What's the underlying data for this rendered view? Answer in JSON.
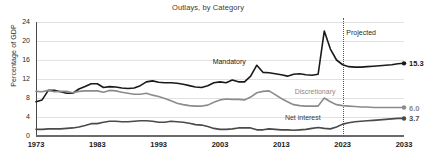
{
  "chart_data": {
    "type": "line",
    "title": "Outlays, by Category",
    "xlabel": "",
    "ylabel": "Percentage of GDP",
    "xlim": [
      1973,
      2033
    ],
    "ylim": [
      0,
      24
    ],
    "yticks": [
      0,
      4,
      8,
      12,
      16,
      20,
      24
    ],
    "xticks": [
      1973,
      1983,
      1993,
      2003,
      2013,
      2023,
      2033
    ],
    "grid": true,
    "legend": "inline-annotations",
    "annotations": [
      {
        "text": "Projected",
        "x": 2023.6,
        "y": 22.6
      },
      {
        "text": "Mandatory",
        "x": 2004.5,
        "y": 16.4
      },
      {
        "text": "Discretionary",
        "x": 2018.5,
        "y": 10.2
      },
      {
        "text": "Net interest",
        "x": 2016.5,
        "y": 4.6
      }
    ],
    "projection_start": 2023,
    "x": [
      1973,
      1974,
      1975,
      1976,
      1977,
      1978,
      1979,
      1980,
      1981,
      1982,
      1983,
      1984,
      1985,
      1986,
      1987,
      1988,
      1989,
      1990,
      1991,
      1992,
      1993,
      1994,
      1995,
      1996,
      1997,
      1998,
      1999,
      2000,
      2001,
      2002,
      2003,
      2004,
      2005,
      2006,
      2007,
      2008,
      2009,
      2010,
      2011,
      2012,
      2013,
      2014,
      2015,
      2016,
      2017,
      2018,
      2019,
      2020,
      2021,
      2022,
      2023,
      2024,
      2025,
      2026,
      2027,
      2028,
      2029,
      2030,
      2031,
      2032,
      2033
    ],
    "series": [
      {
        "name": "Mandatory",
        "color": "#1a1a1a",
        "end_label": "15.3",
        "end_value": 15.3,
        "values": [
          7.2,
          7.6,
          9.6,
          9.6,
          9.3,
          9.0,
          9.0,
          9.9,
          10.4,
          11.0,
          11.0,
          10.2,
          10.4,
          10.3,
          10.1,
          10.0,
          10.1,
          10.6,
          11.4,
          11.6,
          11.3,
          11.2,
          11.2,
          11.1,
          10.9,
          10.6,
          10.3,
          10.2,
          10.6,
          11.2,
          11.4,
          11.2,
          11.8,
          11.4,
          11.4,
          12.6,
          14.9,
          13.4,
          13.3,
          13.1,
          12.9,
          12.6,
          13.0,
          13.1,
          12.9,
          12.8,
          13.0,
          22.1,
          18.3,
          16.0,
          15.0,
          14.6,
          14.5,
          14.5,
          14.6,
          14.7,
          14.8,
          14.9,
          15.0,
          15.2,
          15.3
        ]
      },
      {
        "name": "Discretionary",
        "color": "#8b8b8b",
        "end_label": "6.0",
        "end_value": 6.0,
        "values": [
          9.4,
          9.3,
          9.6,
          9.3,
          9.4,
          9.4,
          9.1,
          9.4,
          9.5,
          9.5,
          9.5,
          9.2,
          9.6,
          9.5,
          9.2,
          9.0,
          8.8,
          8.8,
          9.0,
          8.6,
          8.3,
          7.9,
          7.4,
          6.9,
          6.6,
          6.4,
          6.3,
          6.3,
          6.5,
          7.1,
          7.6,
          7.8,
          7.7,
          7.7,
          7.6,
          8.2,
          9.1,
          9.4,
          9.5,
          8.7,
          7.9,
          7.2,
          6.6,
          6.4,
          6.3,
          6.3,
          6.3,
          8.0,
          7.2,
          6.6,
          6.4,
          6.3,
          6.2,
          6.1,
          6.1,
          6.0,
          6.0,
          6.0,
          6.0,
          6.0,
          6.0
        ]
      },
      {
        "name": "Net interest",
        "color": "#4a4a4a",
        "end_label": "3.7",
        "end_value": 3.7,
        "values": [
          1.4,
          1.4,
          1.5,
          1.5,
          1.5,
          1.6,
          1.7,
          1.9,
          2.2,
          2.6,
          2.6,
          2.9,
          3.1,
          3.1,
          3.0,
          3.0,
          3.1,
          3.2,
          3.2,
          3.1,
          2.9,
          2.9,
          3.1,
          3.0,
          2.9,
          2.7,
          2.4,
          2.3,
          2.0,
          1.6,
          1.4,
          1.4,
          1.5,
          1.7,
          1.7,
          1.7,
          1.3,
          1.3,
          1.5,
          1.4,
          1.3,
          1.3,
          1.2,
          1.3,
          1.4,
          1.6,
          1.8,
          1.6,
          1.5,
          1.9,
          2.5,
          2.8,
          3.0,
          3.1,
          3.2,
          3.3,
          3.4,
          3.5,
          3.6,
          3.7,
          3.7
        ]
      }
    ]
  }
}
